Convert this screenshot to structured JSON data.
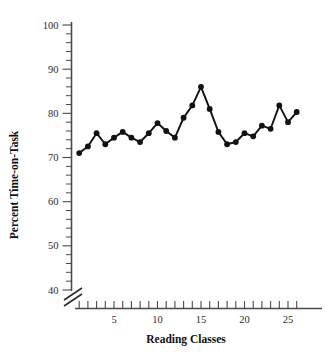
{
  "chart_data": {
    "type": "line",
    "title": "",
    "xlabel": "Reading Classes",
    "ylabel": "Percent Time-on-Task",
    "x": [
      1,
      2,
      3,
      4,
      5,
      6,
      7,
      8,
      9,
      10,
      11,
      12,
      13,
      14,
      15,
      16,
      17,
      18,
      19,
      20,
      21,
      22,
      23,
      24,
      25,
      26
    ],
    "values": [
      71.0,
      72.5,
      75.5,
      73.0,
      74.5,
      75.8,
      74.5,
      73.5,
      75.5,
      77.8,
      76.0,
      74.5,
      79.0,
      81.8,
      86.0,
      81.0,
      75.8,
      73.0,
      73.5,
      75.5,
      74.8,
      77.2,
      76.5,
      81.8,
      78.0,
      80.3
    ],
    "series": [
      {
        "name": "Percent Time-on-Task",
        "values": [
          71.0,
          72.5,
          75.5,
          73.0,
          74.5,
          75.8,
          74.5,
          73.5,
          75.5,
          77.8,
          76.0,
          74.5,
          79.0,
          81.8,
          86.0,
          81.0,
          75.8,
          73.0,
          73.5,
          75.5,
          74.8,
          77.2,
          76.5,
          81.8,
          78.0,
          80.3
        ]
      }
    ],
    "ylim": [
      40,
      102
    ],
    "xlim": [
      0.3,
      26.8
    ],
    "y_major_ticks": [
      40,
      50,
      60,
      70,
      80,
      90,
      100
    ],
    "y_major_labels": [
      "40",
      "50",
      "60",
      "70",
      "80",
      "90",
      "100"
    ],
    "y_minor_step": 2,
    "x_major_ticks": [
      5,
      10,
      15,
      20,
      25
    ],
    "x_major_labels": [
      "5",
      "10",
      "15",
      "20",
      "25"
    ],
    "x_tick_step": 1,
    "axis_break": true,
    "axis_break_label": "y-axis-break",
    "grid": false,
    "legend": "none",
    "marker": "filled-circle",
    "line_color": "#111111",
    "marker_color": "#111111",
    "axis_color": "#4a4a4a",
    "background_color": "#ffffff"
  }
}
